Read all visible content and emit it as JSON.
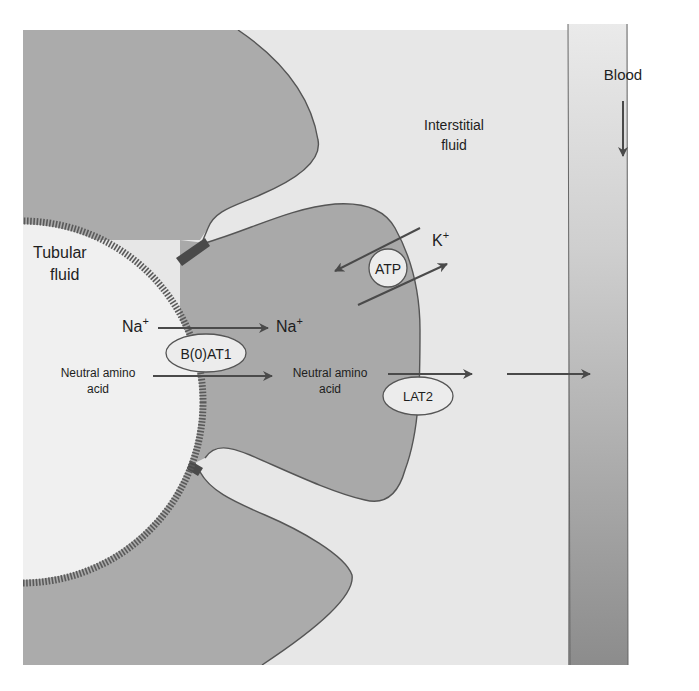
{
  "diagram": {
    "regions": {
      "tubular_fluid": "Tubular fluid",
      "tubular_fluid_line1": "Tubular",
      "tubular_fluid_line2": "fluid",
      "interstitial_fluid_line1": "Interstitial",
      "interstitial_fluid_line2": "fluid",
      "blood": "Blood"
    },
    "ions": {
      "na_left": "Na",
      "na_right": "Na",
      "na_charge": "+",
      "k": "K",
      "k_charge": "+"
    },
    "substrates": {
      "amino_left_line1": "Neutral amino",
      "amino_left_line2": "acid",
      "amino_right_line1": "Neutral amino",
      "amino_right_line2": "acid"
    },
    "transporters": {
      "apical": "B(0)AT1",
      "pump": "ATP",
      "basolateral": "LAT2"
    },
    "colors": {
      "cell": "#aaaaaa",
      "lumen": "#eeeeee",
      "interstitial": "#e6e6e6",
      "blood_top": "#e9e9e9",
      "blood_bottom": "#8e8e8e",
      "outline": "#555555",
      "arrow": "#505050",
      "brush_border": "#555555",
      "tight_junction": "#4a4a4a"
    }
  }
}
